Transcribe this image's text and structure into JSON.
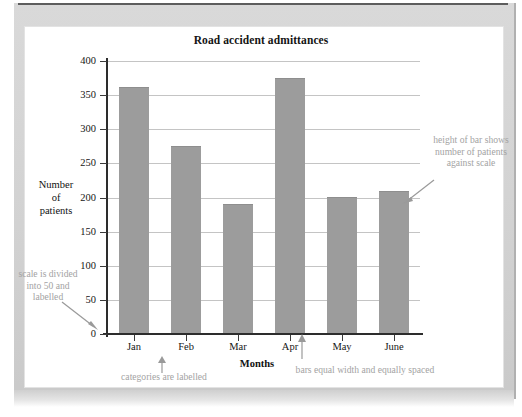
{
  "figure": {
    "title": "Road accident admittances"
  },
  "chart_data": {
    "type": "bar",
    "title": "Road accident admittances",
    "categories": [
      "Jan",
      "Feb",
      "Mar",
      "Apr",
      "May",
      "June"
    ],
    "values": [
      360,
      274,
      189,
      374,
      199,
      208
    ],
    "xlabel": "Months",
    "ylabel": "Number of patients",
    "ylim": [
      0,
      400
    ],
    "ytick_values": [
      0,
      50,
      100,
      150,
      200,
      250,
      300,
      350,
      400
    ],
    "ytick_labels": [
      "0",
      "50",
      "100",
      "150",
      "200",
      "250",
      "300",
      "350",
      "400"
    ],
    "ytick_step": 50,
    "grid": true,
    "legend": false,
    "bar_color": "#9c9c9c",
    "axis_color": "#2d2d2d",
    "gridline_color": "#c4c4c4"
  },
  "axis_titles": {
    "y_line1": "Number",
    "y_line2": "of",
    "y_line3": "patients",
    "x": "Months"
  },
  "annotations": {
    "scale": "scale is divided into 50 and labelled",
    "height": "height of bar shows number of patients against scale",
    "categories": "categories are labelled",
    "bars": "bars equal width and equally spaced",
    "color": "#a3a3a3"
  }
}
